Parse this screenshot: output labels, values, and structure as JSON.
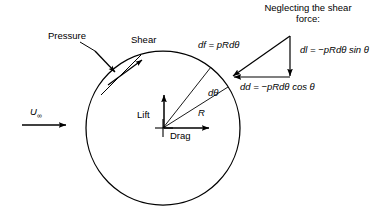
{
  "figure": {
    "type": "fluid-dynamics-force-diagram",
    "geometry": {
      "circle": {
        "cx": 163,
        "cy": 128,
        "r": 77
      },
      "angle_label": "dθ"
    }
  },
  "heading": {
    "line1": "Neglecting the shear",
    "line2": "force:"
  },
  "labels": {
    "pressure": "Pressure",
    "shear": "Shear",
    "lift": "Lift",
    "drag": "Drag",
    "radius": "R",
    "d_theta": "dθ",
    "freestream_symbol": "U",
    "freestream_subscript": "∞"
  },
  "equations": {
    "df": "df = pRdθ",
    "dl": "dl = −pRdθ sin θ",
    "dd": "dd = −pRdθ cos θ"
  },
  "colors": {
    "stroke": "#000000",
    "background": "#ffffff",
    "text": "#000000"
  }
}
